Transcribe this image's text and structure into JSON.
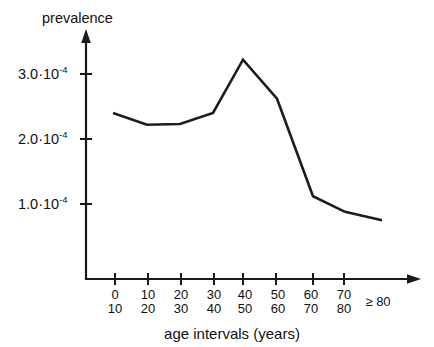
{
  "chart_data": {
    "type": "line",
    "title": "",
    "ylabel": "prevalence",
    "xlabel": "age  intervals  (years)",
    "categories": [
      "0\n10",
      "10\n20",
      "20\n30",
      "30\n40",
      "40\n50",
      "50\n60",
      "60\n70",
      "70\n80",
      "≥ 80"
    ],
    "category_upper": [
      "0",
      "10",
      "20",
      "30",
      "40",
      "50",
      "60",
      "70",
      "≥ 80"
    ],
    "category_lower": [
      "10",
      "20",
      "30",
      "40",
      "50",
      "60",
      "70",
      "80",
      ""
    ],
    "values": [
      0.00024,
      0.000222,
      0.000223,
      0.00024,
      0.000322,
      0.000262,
      0.000112,
      8.8e-05,
      7.5e-05
    ],
    "values_scaled": [
      2.4,
      2.22,
      2.23,
      2.4,
      3.22,
      2.62,
      1.12,
      0.88,
      0.75
    ],
    "value_scale": "1e-4",
    "ytick_values": [
      0.0001,
      0.0002,
      0.0003
    ],
    "ytick_mantissas": [
      "1.0",
      "2.0",
      "3.0"
    ],
    "ytick_base": "10",
    "ytick_exponent": "-4",
    "ytick_separator": "·",
    "ylim": [
      0,
      0.00036
    ],
    "grid": false,
    "legend": false,
    "line_color": "#1d1d1d"
  },
  "axes": {
    "y_axis_label": "prevalence",
    "x_axis_label": "age  intervals  (years)",
    "y_ticks": [
      {
        "mantissa": "3.0",
        "sep": "·",
        "base": "10",
        "exp": "-4"
      },
      {
        "mantissa": "2.0",
        "sep": "·",
        "base": "10",
        "exp": "-4"
      },
      {
        "mantissa": "1.0",
        "sep": "·",
        "base": "10",
        "exp": "-4"
      }
    ],
    "x_ticks": [
      {
        "top": "0",
        "bottom": "10"
      },
      {
        "top": "10",
        "bottom": "20"
      },
      {
        "top": "20",
        "bottom": "30"
      },
      {
        "top": "30",
        "bottom": "40"
      },
      {
        "top": "40",
        "bottom": "50"
      },
      {
        "top": "50",
        "bottom": "60"
      },
      {
        "top": "60",
        "bottom": "70"
      },
      {
        "top": "70",
        "bottom": "80"
      },
      {
        "top": "≥ 80",
        "bottom": ""
      }
    ]
  },
  "colors": {
    "line": "#1d1d1d",
    "axis": "#1a1a1a",
    "text": "#111111",
    "background": "#ffffff"
  }
}
